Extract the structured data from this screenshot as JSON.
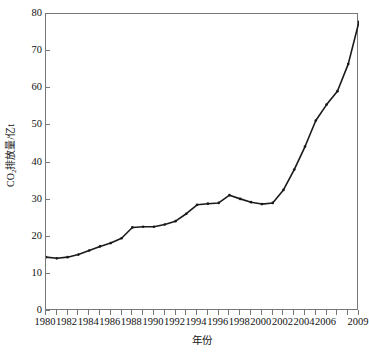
{
  "chart_data": {
    "type": "line",
    "title": "",
    "subtitle": "",
    "xlabel": "年份",
    "ylabel": "CO2排放量/亿t",
    "ylabel_parts": {
      "prefix": "CO",
      "sub": "2",
      "suffix": "排放量/亿t"
    },
    "xlim": [
      1980,
      2009
    ],
    "ylim": [
      0,
      80
    ],
    "grid": false,
    "legend": null,
    "legend_position": "none",
    "y_ticks": [
      0,
      10,
      20,
      30,
      40,
      50,
      60,
      70,
      80
    ],
    "y_tick_labels": [
      "0",
      "10",
      "20",
      "30",
      "40",
      "50",
      "60",
      "70",
      "80"
    ],
    "x_ticks": [
      1980,
      1982,
      1984,
      1986,
      1988,
      1990,
      1992,
      1994,
      1996,
      1998,
      2000,
      2002,
      2004,
      2006,
      2009
    ],
    "x_tick_labels": [
      "1980",
      "1982",
      "1984",
      "1986",
      "1988",
      "1990",
      "1992",
      "1994",
      "1996",
      "1998",
      "2000",
      "2002",
      "2004",
      "2006",
      "2009"
    ],
    "x_minor_ticks": [
      1981,
      1983,
      1985,
      1987,
      1989,
      1991,
      1993,
      1995,
      1997,
      1999,
      2001,
      2003,
      2005,
      2007,
      2008
    ],
    "series": [
      {
        "name": "CO2排放量",
        "color": "#1a1a1a",
        "marker": "dot",
        "x": [
          1980,
          1981,
          1982,
          1983,
          1984,
          1985,
          1986,
          1987,
          1988,
          1989,
          1990,
          1991,
          1992,
          1993,
          1994,
          1995,
          1996,
          1997,
          1998,
          1999,
          2000,
          2001,
          2002,
          2003,
          2004,
          2005,
          2006,
          2007,
          2008,
          2009
        ],
        "values": [
          14.5,
          14.2,
          14.5,
          15.2,
          16.3,
          17.4,
          18.3,
          19.6,
          22.5,
          22.7,
          22.7,
          23.3,
          24.2,
          26.2,
          28.6,
          28.9,
          29.1,
          31.2,
          30.2,
          29.3,
          28.8,
          29.1,
          32.6,
          38.1,
          44.3,
          51.3,
          55.6,
          59.2,
          66.5,
          77.9
        ]
      }
    ],
    "axis_color": "#777777",
    "text_color": "#111111",
    "background": "#ffffff"
  }
}
